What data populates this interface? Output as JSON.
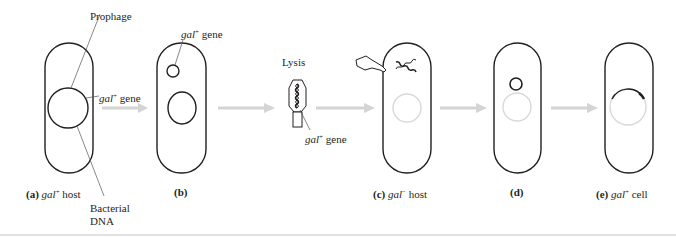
{
  "figure": {
    "colors": {
      "ink": "#231f20",
      "arrow": "#d4d4d4",
      "faded_dna": "#d9d9d9",
      "rule": "#e2e2e2"
    },
    "callouts": {
      "prophage": "Prophage",
      "gal_gene_a": {
        "gene": "gal",
        "sup": "+",
        "suffix": "gene"
      },
      "bacterial_dna_line1": "Bacterial",
      "bacterial_dna_line2": "DNA",
      "gal_gene_b": {
        "gene": "gal",
        "sup": "+",
        "suffix": "gene"
      },
      "lysis": "Lysis",
      "gal_gene_phage": {
        "gene": "gal",
        "sup": "+",
        "suffix": "gene"
      }
    },
    "panels": [
      {
        "letter": "(a)",
        "gene": "gal",
        "sup": "+",
        "suffix": "host"
      },
      {
        "letter": "(b)",
        "gene": "",
        "sup": "",
        "suffix": ""
      },
      {
        "letter": "(c)",
        "gene": "gal",
        "sup": "−",
        "suffix": "host"
      },
      {
        "letter": "(d)",
        "gene": "",
        "sup": "",
        "suffix": ""
      },
      {
        "letter": "(e)",
        "gene": "gal",
        "sup": "+",
        "suffix": "cell"
      }
    ],
    "steps": [
      "gal+ host with prophage",
      "prophage excised carrying gal+ gene",
      "lysis releases transducing phage",
      "infects gal- host",
      "gal+ DNA enters host",
      "recombination yields gal+ cell"
    ]
  }
}
